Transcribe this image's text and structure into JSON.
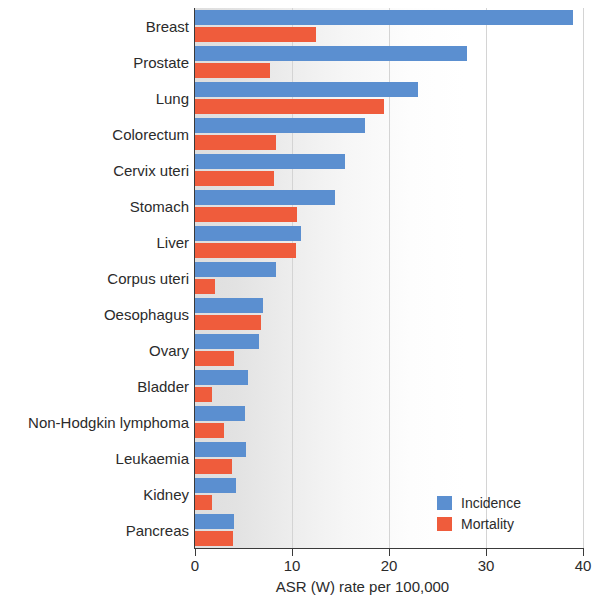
{
  "chart_data": {
    "type": "bar",
    "orientation": "horizontal",
    "title": "",
    "xlabel": "ASR (W) rate per 100,000",
    "ylabel": "",
    "xlim": [
      0,
      40
    ],
    "xticks": [
      0,
      10,
      20,
      30,
      40
    ],
    "xtick_labels": [
      "0",
      "10",
      "20",
      "30",
      "40"
    ],
    "grid": true,
    "legend_position": "bottom-right",
    "categories": [
      "Breast",
      "Prostate",
      "Lung",
      "Colorectum",
      "Cervix uteri",
      "Stomach",
      "Liver",
      "Corpus uteri",
      "Oesophagus",
      "Ovary",
      "Bladder",
      "Non-Hodgkin lymphoma",
      "Leukaemia",
      "Kidney",
      "Pancreas"
    ],
    "series": [
      {
        "name": "Incidence",
        "color": "#5b8fd0",
        "values": [
          39.0,
          28.0,
          23.0,
          17.5,
          15.5,
          14.4,
          10.9,
          8.4,
          7.0,
          6.6,
          5.5,
          5.2,
          5.3,
          4.2,
          4.0
        ]
      },
      {
        "name": "Mortality",
        "color": "#ef5c3c",
        "values": [
          12.5,
          7.7,
          19.5,
          8.4,
          8.1,
          10.5,
          10.4,
          2.1,
          6.8,
          4.0,
          1.8,
          3.0,
          3.8,
          1.8,
          3.9
        ]
      }
    ]
  },
  "legend": {
    "items": [
      {
        "label": "Incidence",
        "color": "#5b8fd0"
      },
      {
        "label": "Mortality",
        "color": "#ef5c3c"
      }
    ]
  },
  "artifact": {
    "line1": "",
    "line2": ""
  }
}
